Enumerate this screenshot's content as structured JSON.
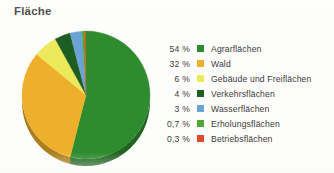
{
  "title": "Fläche",
  "chart_data": {
    "type": "pie",
    "title": "Fläche",
    "xlabel": "",
    "ylabel": "",
    "legend_position": "right",
    "grid": false,
    "unit": "%",
    "categories": [
      "Agrarflächen",
      "Wald",
      "Gebäude und Freiflächen",
      "Verkehrsflächen",
      "Wasserflächen",
      "Erholungsflächen",
      "Betriebsflächen"
    ],
    "values": [
      54,
      32,
      6,
      4,
      3,
      0.7,
      0.3
    ],
    "value_labels": [
      "54 %",
      "32 %",
      "6 %",
      "4 %",
      "3 %",
      "0,7 %",
      "0,3 %"
    ],
    "colors": [
      "#2e8b2e",
      "#eeb02a",
      "#ece95a",
      "#1f5e23",
      "#6ba3d6",
      "#4ea832",
      "#e04a28"
    ]
  },
  "legend": {
    "rows": [
      {
        "value": "54 %",
        "label": "Agrarflächen",
        "color": "#2e8b2e"
      },
      {
        "value": "32 %",
        "label": "Wald",
        "color": "#eeb02a"
      },
      {
        "value": "6 %",
        "label": "Gebäude und Freiflächen",
        "color": "#ece95a"
      },
      {
        "value": "4 %",
        "label": "Verkehrsflächen",
        "color": "#1f5e23"
      },
      {
        "value": "3 %",
        "label": "Wasserflächen",
        "color": "#6ba3d6"
      },
      {
        "value": "0,7 %",
        "label": "Erholungsflächen",
        "color": "#4ea832"
      },
      {
        "value": "0,3 %",
        "label": "Betriebsflächen",
        "color": "#e04a28"
      }
    ]
  },
  "pie_geometry": {
    "cx": 66,
    "cy": 67,
    "rx": 64,
    "ry": 64,
    "depth": 7,
    "start_angle_deg": -90
  }
}
